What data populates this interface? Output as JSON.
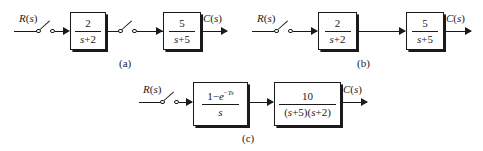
{
  "figure": {
    "background_color": "#ffffff",
    "line_color": "#1a1a1a",
    "width": 483,
    "height": 151
  },
  "diagrams": [
    {
      "caption": "(a)",
      "input_label": "R(s)",
      "output_label": "C(s)",
      "samplers": 2,
      "blocks": [
        {
          "numerator": "2",
          "denominator": "s+2"
        },
        {
          "numerator": "5",
          "denominator": "s+5"
        }
      ]
    },
    {
      "caption": "(b)",
      "input_label": "R(s)",
      "output_label": "C(s)",
      "samplers": 1,
      "blocks": [
        {
          "numerator": "2",
          "denominator": "s+2"
        },
        {
          "numerator": "5",
          "denominator": "s+5"
        }
      ]
    },
    {
      "caption": "(c)",
      "input_label": "R(s)",
      "output_label": "C(s)",
      "samplers": 1,
      "blocks": [
        {
          "numerator": "1−e",
          "numerator_exponent": "−Ts",
          "denominator": "s"
        },
        {
          "numerator": "10",
          "denominator": "(s+5)(s+2)"
        }
      ]
    }
  ],
  "a": {
    "input": "R(s)",
    "output": "C(s)",
    "caption": "(a)",
    "block1": {
      "num": "2",
      "den": "s+2"
    },
    "block2": {
      "num": "5",
      "den": "s+5"
    }
  },
  "b": {
    "input": "R(s)",
    "output": "C(s)",
    "caption": "(b)",
    "block1": {
      "num": "2",
      "den": "s+2"
    },
    "block2": {
      "num": "5",
      "den": "s+5"
    }
  },
  "c": {
    "input": "R(s)",
    "output": "C(s)",
    "caption": "(c)",
    "block1": {
      "num": "1−e",
      "exp": "−Ts",
      "den": "s"
    },
    "block2": {
      "num": "10",
      "den": "(s+5)(s+2)"
    }
  }
}
